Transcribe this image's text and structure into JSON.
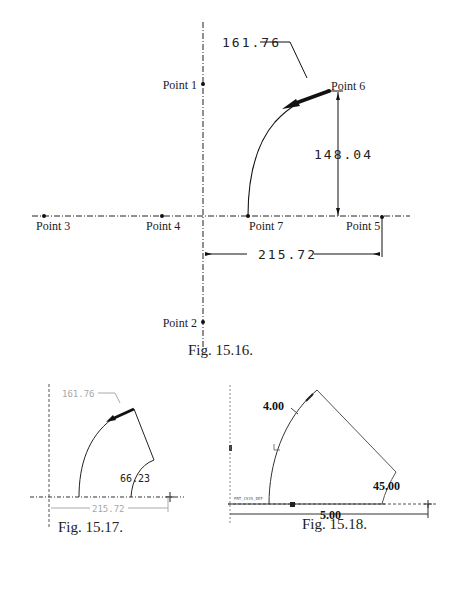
{
  "figures": [
    {
      "id": "fig-15-16",
      "caption": "Fig. 15.16.",
      "points": [
        {
          "label": "Point 1"
        },
        {
          "label": "Point 2"
        },
        {
          "label": "Point 3"
        },
        {
          "label": "Point 4"
        },
        {
          "label": "Point 5"
        },
        {
          "label": "Point 6"
        },
        {
          "label": "Point 7"
        }
      ],
      "dimensions": {
        "radius": "161.76",
        "vertical": "148.04",
        "horizontal": "215.72"
      }
    },
    {
      "id": "fig-15-17",
      "caption": "Fig. 15.17.",
      "dimensions": {
        "radius": "161.76",
        "angle": "66.23",
        "horizontal": "215.72"
      }
    },
    {
      "id": "fig-15-18",
      "caption": "Fig. 15.18.",
      "dimensions": {
        "radius": "4.00",
        "angle": "45.00",
        "horizontal": "5.00"
      },
      "csys_label": "PRT_CSYS_DEF"
    }
  ],
  "colors": {
    "line": "#111111",
    "faded": "#a8a8a8",
    "text": "#222222"
  }
}
